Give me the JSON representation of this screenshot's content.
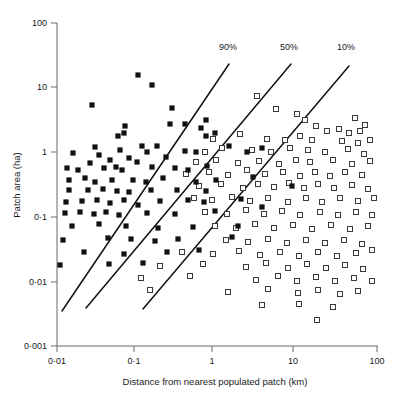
{
  "figure": {
    "background": "#ffffff",
    "ink_color": "#111111",
    "axis_color": "#6b6b6b"
  },
  "chart_data": {
    "type": "scatter",
    "title": "",
    "xlabel": "Distance from nearest populated patch (km)",
    "ylabel": "Patch area (ha)",
    "xscale": "log",
    "yscale": "log",
    "xlim": [
      0.01,
      100
    ],
    "ylim": [
      0.001,
      100
    ],
    "grid": false,
    "legend_position": "none",
    "xtick_labels": [
      "0·01",
      "0·1",
      "1",
      "10",
      "100"
    ],
    "xtick_values": [
      0.01,
      0.1,
      1,
      10,
      100
    ],
    "ytick_labels": [
      "0·001",
      "0·01",
      "0·1",
      "1",
      "10",
      "100"
    ],
    "ytick_values": [
      0.001,
      0.01,
      0.1,
      1,
      10,
      100
    ],
    "annotations": [
      {
        "text": "90%",
        "x_px": 228,
        "y_px": 50
      },
      {
        "text": "50%",
        "x_px": 289,
        "y_px": 50
      },
      {
        "text": "10%",
        "x_px": 346,
        "y_px": 50
      }
    ],
    "lines": [
      {
        "name": "90%",
        "x_px": [
          62,
          229
        ],
        "y_px": [
          311,
          64
        ]
      },
      {
        "name": "50%",
        "x_px": [
          86,
          291
        ],
        "y_px": [
          308,
          64
        ]
      },
      {
        "name": "10%",
        "x_px": [
          143,
          349
        ],
        "y_px": [
          309,
          66
        ]
      }
    ],
    "series": [
      {
        "name": "occupied patch",
        "marker": "filled-square",
        "color": "#111111",
        "points_px": [
          [
            138,
            75
          ],
          [
            152,
            85
          ],
          [
            92,
            105
          ],
          [
            172,
            108
          ],
          [
            170,
            124
          ],
          [
            125,
            126
          ],
          [
            185,
            124
          ],
          [
            206,
            120
          ],
          [
            118,
            136
          ],
          [
            124,
            133
          ],
          [
            201,
            128
          ],
          [
            206,
            136
          ],
          [
            215,
            133
          ],
          [
            142,
            146
          ],
          [
            157,
            146
          ],
          [
            120,
            150
          ],
          [
            147,
            152
          ],
          [
            73,
            153
          ],
          [
            95,
            147
          ],
          [
            99,
            155
          ],
          [
            90,
            163
          ],
          [
            110,
            160
          ],
          [
            129,
            158
          ],
          [
            137,
            162
          ],
          [
            166,
            157
          ],
          [
            185,
            151
          ],
          [
            196,
            152
          ],
          [
            229,
            146
          ],
          [
            247,
            152
          ],
          [
            262,
            148
          ],
          [
            67,
            168
          ],
          [
            78,
            170
          ],
          [
            104,
            168
          ],
          [
            116,
            167
          ],
          [
            122,
            170
          ],
          [
            152,
            167
          ],
          [
            175,
            168
          ],
          [
            188,
            170
          ],
          [
            207,
            166
          ],
          [
            69,
            180
          ],
          [
            85,
            178
          ],
          [
            95,
            182
          ],
          [
            112,
            180
          ],
          [
            133,
            180
          ],
          [
            146,
            182
          ],
          [
            163,
            178
          ],
          [
            196,
            182
          ],
          [
            216,
            180
          ],
          [
            253,
            177
          ],
          [
            69,
            190
          ],
          [
            88,
            190
          ],
          [
            103,
            189
          ],
          [
            117,
            191
          ],
          [
            129,
            192
          ],
          [
            151,
            190
          ],
          [
            177,
            190
          ],
          [
            206,
            191
          ],
          [
            292,
            186
          ],
          [
            66,
            202
          ],
          [
            82,
            201
          ],
          [
            97,
            200
          ],
          [
            110,
            203
          ],
          [
            124,
            200
          ],
          [
            138,
            205
          ],
          [
            160,
            201
          ],
          [
            188,
            200
          ],
          [
            204,
            202
          ],
          [
            241,
            199
          ],
          [
            65,
            213
          ],
          [
            80,
            212
          ],
          [
            94,
            214
          ],
          [
            106,
            212
          ],
          [
            119,
            215
          ],
          [
            147,
            213
          ],
          [
            175,
            214
          ],
          [
            215,
            211
          ],
          [
            262,
            207
          ],
          [
            72,
            226
          ],
          [
            99,
            224
          ],
          [
            126,
            226
          ],
          [
            158,
            228
          ],
          [
            193,
            227
          ],
          [
            238,
            226
          ],
          [
            63,
            240
          ],
          [
            108,
            238
          ],
          [
            131,
            239
          ],
          [
            155,
            241
          ],
          [
            178,
            239
          ],
          [
            232,
            237
          ],
          [
            84,
            252
          ],
          [
            124,
            254
          ],
          [
            167,
            252
          ],
          [
            199,
            250
          ],
          [
            60,
            265
          ],
          [
            109,
            264
          ],
          [
            143,
            263
          ]
        ]
      },
      {
        "name": "unoccupied patch",
        "marker": "open-square",
        "color": "#ffffff",
        "points_px": [
          [
            257,
            96
          ],
          [
            276,
            109
          ],
          [
            297,
            114
          ],
          [
            305,
            120
          ],
          [
            355,
            118
          ],
          [
            365,
            125
          ],
          [
            360,
            131
          ],
          [
            339,
            129
          ],
          [
            349,
            133
          ],
          [
            327,
            131
          ],
          [
            316,
            126
          ],
          [
            213,
            139
          ],
          [
            240,
            134
          ],
          [
            267,
            139
          ],
          [
            285,
            140
          ],
          [
            300,
            136
          ],
          [
            312,
            140
          ],
          [
            342,
            141
          ],
          [
            358,
            143
          ],
          [
            370,
            140
          ],
          [
            205,
            152
          ],
          [
            222,
            148
          ],
          [
            252,
            150
          ],
          [
            271,
            152
          ],
          [
            290,
            148
          ],
          [
            308,
            150
          ],
          [
            325,
            152
          ],
          [
            348,
            149
          ],
          [
            364,
            154
          ],
          [
            196,
            162
          ],
          [
            216,
            160
          ],
          [
            238,
            163
          ],
          [
            259,
            161
          ],
          [
            279,
            164
          ],
          [
            296,
            160
          ],
          [
            310,
            162
          ],
          [
            333,
            160
          ],
          [
            352,
            164
          ],
          [
            370,
            161
          ],
          [
            186,
            174
          ],
          [
            209,
            172
          ],
          [
            228,
            175
          ],
          [
            247,
            170
          ],
          [
            265,
            174
          ],
          [
            283,
            172
          ],
          [
            300,
            176
          ],
          [
            315,
            172
          ],
          [
            330,
            176
          ],
          [
            345,
            172
          ],
          [
            362,
            175
          ],
          [
            199,
            186
          ],
          [
            221,
            184
          ],
          [
            243,
            188
          ],
          [
            258,
            184
          ],
          [
            274,
            187
          ],
          [
            289,
            183
          ],
          [
            304,
            188
          ],
          [
            318,
            184
          ],
          [
            334,
            188
          ],
          [
            352,
            185
          ],
          [
            368,
            189
          ],
          [
            194,
            198
          ],
          [
            212,
            200
          ],
          [
            232,
            197
          ],
          [
            250,
            201
          ],
          [
            268,
            198
          ],
          [
            288,
            202
          ],
          [
            306,
            198
          ],
          [
            322,
            202
          ],
          [
            340,
            198
          ],
          [
            358,
            201
          ],
          [
            374,
            198
          ],
          [
            205,
            212
          ],
          [
            227,
            214
          ],
          [
            246,
            210
          ],
          [
            264,
            214
          ],
          [
            282,
            211
          ],
          [
            300,
            215
          ],
          [
            320,
            212
          ],
          [
            338,
            215
          ],
          [
            356,
            212
          ],
          [
            372,
            215
          ],
          [
            215,
            226
          ],
          [
            236,
            228
          ],
          [
            255,
            224
          ],
          [
            274,
            228
          ],
          [
            293,
            225
          ],
          [
            312,
            229
          ],
          [
            331,
            225
          ],
          [
            350,
            229
          ],
          [
            368,
            226
          ],
          [
            226,
            240
          ],
          [
            248,
            242
          ],
          [
            268,
            239
          ],
          [
            287,
            243
          ],
          [
            306,
            240
          ],
          [
            325,
            243
          ],
          [
            344,
            240
          ],
          [
            362,
            244
          ],
          [
            182,
            252
          ],
          [
            213,
            254
          ],
          [
            239,
            251
          ],
          [
            260,
            255
          ],
          [
            280,
            252
          ],
          [
            299,
            256
          ],
          [
            318,
            252
          ],
          [
            337,
            256
          ],
          [
            356,
            253
          ],
          [
            372,
            250
          ],
          [
            160,
            266
          ],
          [
            203,
            264
          ],
          [
            246,
            267
          ],
          [
            266,
            263
          ],
          [
            288,
            268
          ],
          [
            307,
            264
          ],
          [
            326,
            268
          ],
          [
            345,
            265
          ],
          [
            363,
            269
          ],
          [
            141,
            278
          ],
          [
            190,
            276
          ],
          [
            256,
            280
          ],
          [
            278,
            276
          ],
          [
            297,
            281
          ],
          [
            316,
            277
          ],
          [
            335,
            281
          ],
          [
            354,
            278
          ],
          [
            372,
            281
          ],
          [
            150,
            290
          ],
          [
            228,
            292
          ],
          [
            268,
            289
          ],
          [
            298,
            293
          ],
          [
            318,
            290
          ],
          [
            340,
            294
          ],
          [
            358,
            291
          ],
          [
            262,
            305
          ],
          [
            299,
            304
          ],
          [
            333,
            307
          ],
          [
            317,
            320
          ]
        ]
      }
    ]
  },
  "geometry": {
    "plot_left_px": 57,
    "plot_right_px": 378,
    "plot_top_px": 23,
    "plot_bottom_px": 346
  }
}
